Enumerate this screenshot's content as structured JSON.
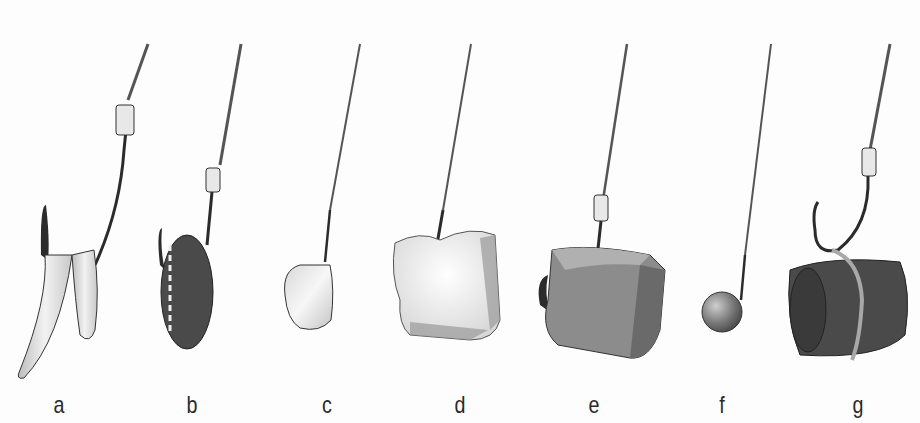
{
  "figure": {
    "palette": {
      "line": "#3a3a3a",
      "hook": "#2b2b2b",
      "light_bait": "#e6e6e6",
      "mid_bait": "#8c8c8c",
      "dark_bait": "#4a4a4a",
      "background": "#fdfdfd"
    },
    "items": [
      {
        "label": "a",
        "bait": "worm-pieces",
        "x": 59
      },
      {
        "label": "b",
        "bait": "maggot-grub",
        "x": 192
      },
      {
        "label": "c",
        "bait": "corn-kernel",
        "x": 327
      },
      {
        "label": "d",
        "bait": "bread-chunk",
        "x": 460
      },
      {
        "label": "e",
        "bait": "cheese-chunk",
        "x": 594
      },
      {
        "label": "f",
        "bait": "round-pellet-ball",
        "x": 722
      },
      {
        "label": "g",
        "bait": "rolled-meat-tied",
        "x": 858
      }
    ]
  }
}
